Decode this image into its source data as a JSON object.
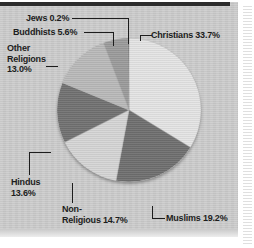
{
  "figure": {
    "background_color": "#c9c9c9",
    "page_color": "#ffffff",
    "rule_color": "#2c2c2c"
  },
  "chart_data": {
    "type": "pie",
    "title": "",
    "subtitle": "",
    "xlabel": "",
    "ylabel": "",
    "legend_position": "none",
    "grid": false,
    "units": "percent",
    "total": 100.0,
    "start_angle_deg": 0,
    "direction": "clockwise",
    "categories": [
      "Christians",
      "Muslims",
      "Non-Religious",
      "Hindus",
      "Other Religions",
      "Buddhists",
      "Jews"
    ],
    "values": [
      33.7,
      19.2,
      14.7,
      13.6,
      13.0,
      5.6,
      0.2
    ],
    "colors": [
      "#e4e4e4",
      "#6f6f6f",
      "#d5d5d5",
      "#717171",
      "#b9b9b9",
      "#9b9b9b",
      "#4a4a4a"
    ],
    "slices": [
      {
        "name": "Christians",
        "value": 33.7,
        "label": "Christians 33.7%",
        "color": "#e4e4e4"
      },
      {
        "name": "Muslims",
        "value": 19.2,
        "label": "Muslims 19.2%",
        "color": "#6f6f6f"
      },
      {
        "name": "Non-Religious",
        "value": 14.7,
        "label": "Non-\nReligious 14.7%",
        "color": "#d5d5d5"
      },
      {
        "name": "Hindus",
        "value": 13.6,
        "label": "Hindus\n13.6%",
        "color": "#717171"
      },
      {
        "name": "Other Religions",
        "value": 13.0,
        "label": "Other\nReligions\n13.0%",
        "color": "#b9b9b9"
      },
      {
        "name": "Buddhists",
        "value": 5.6,
        "label": "Buddhists 5.6%",
        "color": "#9b9b9b"
      },
      {
        "name": "Jews",
        "value": 0.2,
        "label": "Jews 0.2%",
        "color": "#4a4a4a"
      }
    ]
  },
  "labels": {
    "jews": "Jews 0.2%",
    "buddhists": "Buddhists 5.6%",
    "other_religions": "Other\nReligions\n13.0%",
    "christians": "Christians 33.7%",
    "muslims": "Muslims 19.2%",
    "non_religious": "Non-\nReligious 14.7%",
    "hindus": "Hindus\n13.6%"
  }
}
